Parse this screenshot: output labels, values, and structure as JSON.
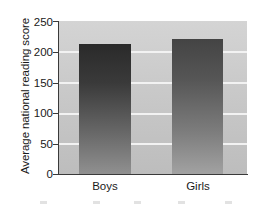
{
  "chart_data": {
    "type": "bar",
    "title": "",
    "subtitle": "",
    "xlabel": "",
    "ylabel": "Average national reading score",
    "categories": [
      "Boys",
      "Girls"
    ],
    "values": [
      212,
      221
    ],
    "series": [
      {
        "name": "Average national reading score",
        "values": [
          212,
          221
        ]
      }
    ],
    "ylim": [
      0,
      250
    ],
    "yticks": [
      0,
      50,
      100,
      150,
      200,
      250
    ],
    "ytick_labels": [
      "0",
      "50",
      "100",
      "150",
      "200",
      "250"
    ],
    "xtick_labels": [
      "Boys",
      "Girls"
    ],
    "grid": true,
    "grid_axis": "y",
    "grid_color": "#f2f2f2",
    "legend": false,
    "legend_position": "none",
    "plot_background": "#c9c9c9",
    "bar_colors": [
      "#3a3a3a",
      "#565656"
    ],
    "annotations": []
  },
  "axes": {
    "y_title": "Average national reading score",
    "y_ticks": [
      {
        "label": "250",
        "value": 250
      },
      {
        "label": "200",
        "value": 200
      },
      {
        "label": "150",
        "value": 150
      },
      {
        "label": "100",
        "value": 100
      },
      {
        "label": "50",
        "value": 50
      },
      {
        "label": "0",
        "value": 0
      }
    ],
    "x_ticks": [
      {
        "label": "Boys"
      },
      {
        "label": "Girls"
      }
    ]
  },
  "bars": [
    {
      "category": "Boys",
      "value": 212
    },
    {
      "category": "Girls",
      "value": 221
    }
  ]
}
